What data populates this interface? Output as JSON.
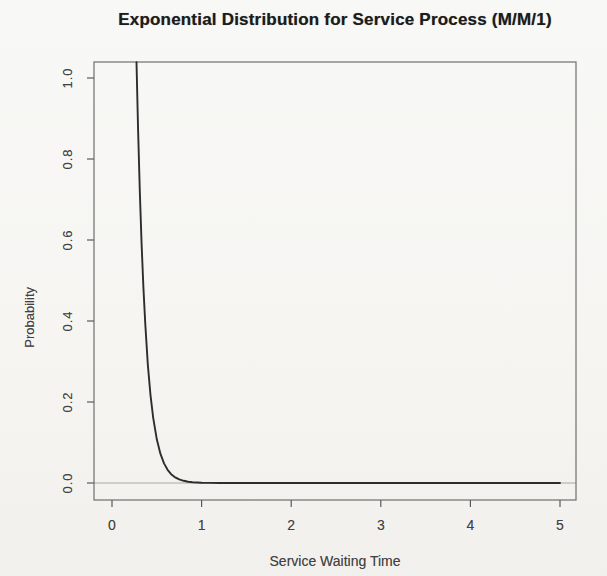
{
  "figure": {
    "kind": "R base plot (photographed page)"
  },
  "chart_data": {
    "type": "line",
    "title": "Exponential Distribution for Service Process (M/M/1)",
    "xlabel": "Service Waiting Time",
    "ylabel": "Probability",
    "xlim": [
      0,
      5
    ],
    "ylim": [
      0,
      1
    ],
    "grid": false,
    "legend": null,
    "x_ticks": [
      0,
      1,
      2,
      3,
      4,
      5
    ],
    "x_tick_labels": [
      "0",
      "1",
      "2",
      "3",
      "4",
      "5"
    ],
    "y_ticks": [
      0.0,
      0.2,
      0.4,
      0.6,
      0.8,
      1.0
    ],
    "y_tick_labels": [
      "0.0",
      "0.2",
      "0.4",
      "0.6",
      "0.8",
      "1.0"
    ],
    "reference_line_y": 0,
    "curve_model": "exponential density, approx. y = 16*exp(-10*x), clipped at top of plot (ylim 0..1, enters frame near x=0.27, ~0 after x=1)",
    "series": [
      {
        "name": "service-time exponential density",
        "points": [
          [
            0.2735,
            1.039
          ],
          [
            0.29,
            0.88
          ],
          [
            0.31,
            0.721
          ],
          [
            0.33,
            0.59
          ],
          [
            0.35,
            0.483
          ],
          [
            0.37,
            0.396
          ],
          [
            0.4,
            0.293
          ],
          [
            0.43,
            0.217
          ],
          [
            0.46,
            0.161
          ],
          [
            0.5,
            0.108
          ],
          [
            0.54,
            0.0723
          ],
          [
            0.58,
            0.0485
          ],
          [
            0.62,
            0.0325
          ],
          [
            0.66,
            0.0218
          ],
          [
            0.7,
            0.0146
          ],
          [
            0.75,
            0.0089
          ],
          [
            0.8,
            0.0054
          ],
          [
            0.85,
            0.0033
          ],
          [
            0.9,
            0.002
          ],
          [
            1.0,
            0.0007
          ],
          [
            1.1,
            0.0003
          ],
          [
            1.2,
            0.0001
          ],
          [
            1.4,
            0.0
          ],
          [
            1.6,
            0.0
          ],
          [
            2.0,
            0.0
          ],
          [
            2.5,
            0.0
          ],
          [
            3.0,
            0.0
          ],
          [
            3.5,
            0.0
          ],
          [
            4.0,
            0.0
          ],
          [
            4.5,
            0.0
          ],
          [
            5.0,
            0.0
          ]
        ]
      }
    ],
    "colors": {
      "background": "#f6f5f2",
      "frame": "#6f6f6f",
      "tick": "#5a5a5a",
      "curve": "#2d2d2d",
      "reference_line": "#aaa9a4",
      "title_text": "#1c1c1c",
      "axis_text": "#424242"
    }
  }
}
